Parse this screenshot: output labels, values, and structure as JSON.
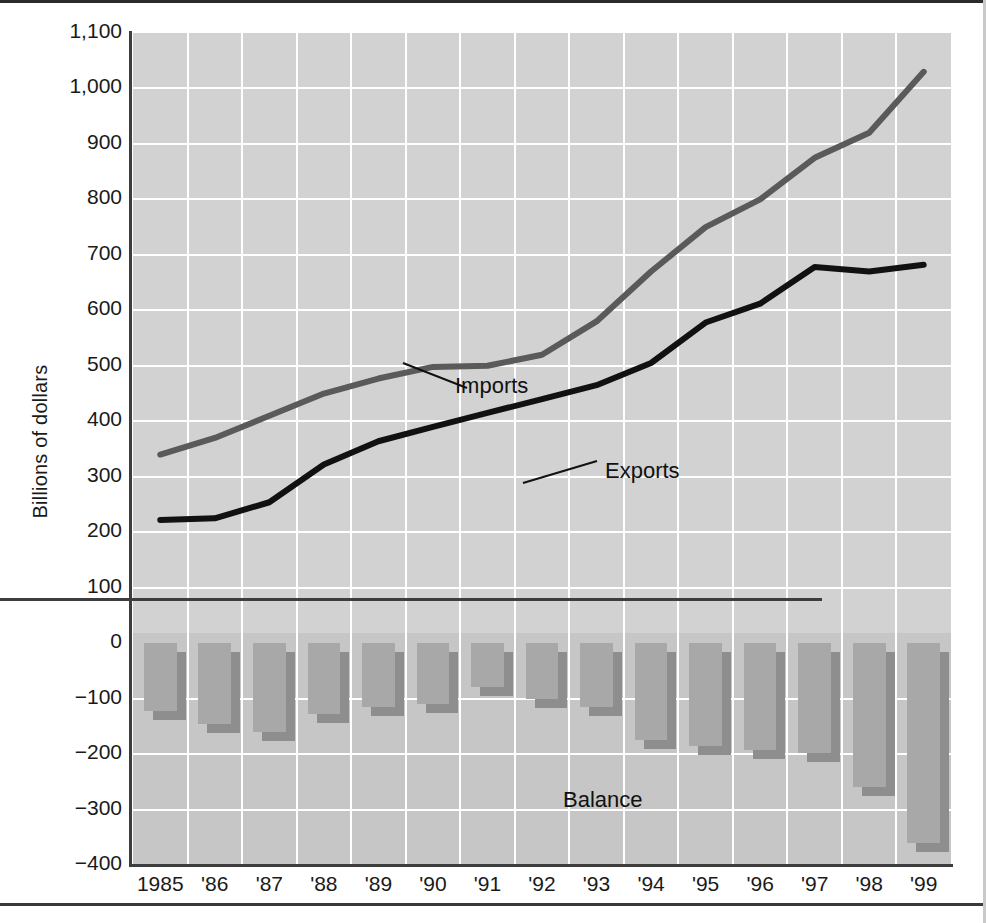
{
  "chart_data": {
    "type": "line",
    "title": "",
    "xlabel": "",
    "ylabel": "Billions of dollars",
    "ylim": [
      -400,
      1100
    ],
    "ytick_values": [
      1100,
      1000,
      900,
      800,
      700,
      600,
      500,
      400,
      300,
      200,
      100,
      0,
      -100,
      -200,
      -300,
      -400
    ],
    "ytick_labels": [
      "1,100",
      "1,000",
      "900",
      "800",
      "700",
      "600",
      "500",
      "400",
      "300",
      "200",
      "100",
      "0",
      "−100",
      "−200",
      "−300",
      "−400"
    ],
    "categories": [
      "1985",
      "'86",
      "'87",
      "'88",
      "'89",
      "'90",
      "'91",
      "'92",
      "'93",
      "'94",
      "'95",
      "'96",
      "'97",
      "'98",
      "'99"
    ],
    "x": [
      1985,
      1986,
      1987,
      1988,
      1989,
      1990,
      1991,
      1992,
      1993,
      1994,
      1995,
      1996,
      1997,
      1998,
      1999
    ],
    "grid": true,
    "legend_position": "inline-annotations",
    "series": [
      {
        "name": "Imports",
        "kind": "line",
        "color": "#5a5a5a",
        "values": [
          340,
          370,
          410,
          450,
          477,
          498,
          500,
          520,
          580,
          670,
          750,
          800,
          875,
          920,
          1030
        ]
      },
      {
        "name": "Exports",
        "kind": "line",
        "color": "#111111",
        "values": [
          222,
          225,
          254,
          322,
          364,
          390,
          415,
          440,
          465,
          505,
          578,
          612,
          678,
          670,
          682
        ]
      },
      {
        "name": "Balance",
        "kind": "bar",
        "color": "#a8a8a8",
        "values": [
          -122,
          -145,
          -160,
          -127,
          -115,
          -110,
          -80,
          -100,
          -115,
          -175,
          -185,
          -192,
          -198,
          -260,
          -360
        ]
      }
    ],
    "annotations": [
      {
        "name": "imports-label",
        "text": "Imports",
        "x_px": 322,
        "y_px": 340
      },
      {
        "name": "exports-label",
        "text": "Exports",
        "x_px": 472,
        "y_px": 425
      },
      {
        "name": "balance-label",
        "text": "Balance",
        "x_px": 430,
        "y_px": 754
      }
    ]
  },
  "labels": {
    "ylabel": "Billions of dollars",
    "imports": "Imports",
    "exports": "Exports",
    "balance": "Balance"
  }
}
